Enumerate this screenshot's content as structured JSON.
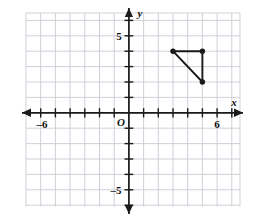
{
  "figure": {
    "kind": "coordinate-plane-with-triangle",
    "background_color": "#ffffff",
    "grid_color": "#c8ccd4",
    "axis_color": "#1a1a1a",
    "shape_color": "#1a1a1a"
  },
  "axes": {
    "x_axis_label": "x",
    "y_axis_label": "y",
    "origin_label": "O",
    "x_tick_labels": [
      {
        "value": -6,
        "text": "–6"
      },
      {
        "value": 6,
        "text": "6"
      }
    ],
    "y_tick_labels": [
      {
        "value": 5,
        "text": "5"
      },
      {
        "value": -5,
        "text": "–5"
      }
    ],
    "x_range": [
      -7,
      7
    ],
    "y_range": [
      -6,
      6
    ],
    "tick_interval": 1,
    "grid": "on"
  },
  "shape": {
    "name": "triangle",
    "vertices": [
      {
        "label": "A",
        "x": 3,
        "y": 4
      },
      {
        "label": "B",
        "x": 5,
        "y": 4
      },
      {
        "label": "C",
        "x": 5,
        "y": 2
      }
    ],
    "closed": true,
    "vertex_marker": "filled-dot"
  },
  "chart_data": {
    "type": "scatter",
    "title": "",
    "xlabel": "x",
    "ylabel": "y",
    "xlim": [
      -7,
      7
    ],
    "ylim": [
      -6,
      6
    ],
    "series": [
      {
        "name": "triangle",
        "x": [
          3,
          5,
          5,
          3
        ],
        "y": [
          4,
          4,
          2,
          4
        ]
      }
    ]
  }
}
